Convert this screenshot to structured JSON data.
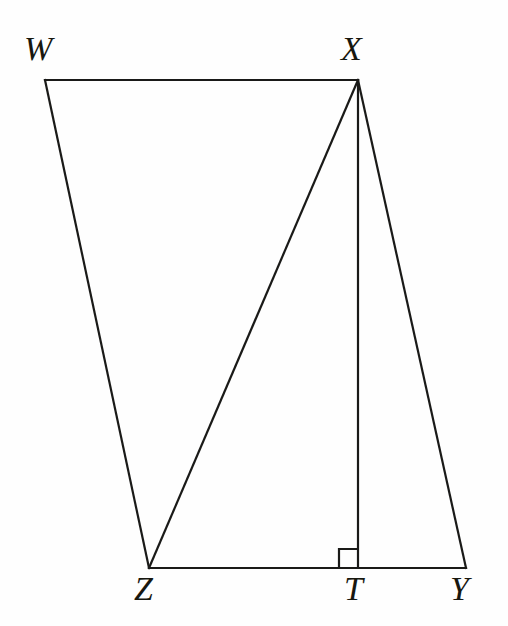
{
  "figure": {
    "canvas": {
      "width": 508,
      "height": 626
    },
    "background_color": "#fefefe",
    "stroke_color": "#1a1a18",
    "label_color": "#17170f",
    "vertices": [
      {
        "id": "W",
        "label": "W",
        "x": 45,
        "y": 80,
        "label_x": 24,
        "label_y": 32
      },
      {
        "id": "X",
        "label": "X",
        "x": 358,
        "y": 80,
        "label_x": 341,
        "label_y": 32
      },
      {
        "id": "Z",
        "label": "Z",
        "x": 149,
        "y": 568,
        "label_x": 134,
        "label_y": 572
      },
      {
        "id": "T",
        "label": "T",
        "x": 358,
        "y": 568,
        "label_x": 344,
        "label_y": 572
      },
      {
        "id": "Y",
        "label": "Y",
        "x": 466,
        "y": 568,
        "label_x": 450,
        "label_y": 572
      }
    ],
    "segments": [
      {
        "name": "segment-WX",
        "from": "W",
        "to": "X",
        "x1": 45,
        "y1": 80,
        "x2": 358,
        "y2": 80
      },
      {
        "name": "segment-WZ",
        "from": "W",
        "to": "Z",
        "x1": 45,
        "y1": 80,
        "x2": 149,
        "y2": 568
      },
      {
        "name": "segment-ZY",
        "from": "Z",
        "to": "Y",
        "x1": 149,
        "y1": 568,
        "x2": 466,
        "y2": 568
      },
      {
        "name": "segment-ZX",
        "from": "Z",
        "to": "X",
        "x1": 149,
        "y1": 568,
        "x2": 358,
        "y2": 80
      },
      {
        "name": "segment-XT",
        "from": "X",
        "to": "T",
        "x1": 358,
        "y1": 80,
        "x2": 358,
        "y2": 568
      },
      {
        "name": "segment-XY",
        "from": "X",
        "to": "Y",
        "x1": 358,
        "y1": 80,
        "x2": 466,
        "y2": 568
      }
    ],
    "right_angle": {
      "at_vertex": "T",
      "size": 19,
      "points": "339,568 339,549 358,549"
    }
  }
}
